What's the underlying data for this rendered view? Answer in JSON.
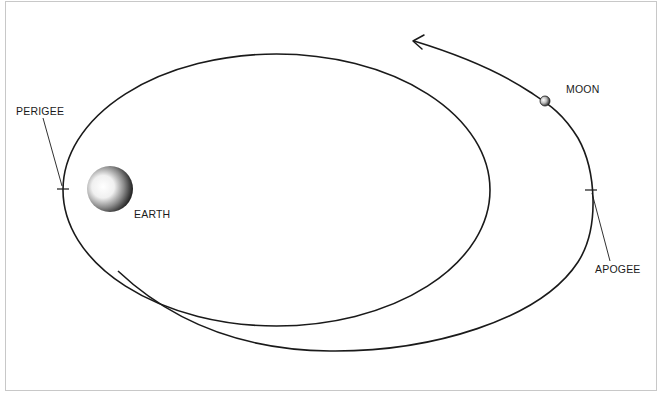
{
  "diagram": {
    "type": "orbit-diagram",
    "labels": {
      "perigee": "PERIGEE",
      "earth": "EARTH",
      "moon": "MOON",
      "apogee": "APOGEE"
    },
    "colors": {
      "line": "#1a1a1a",
      "frame_border": "#c8c8c8",
      "background": "#ffffff"
    },
    "elements": [
      {
        "name": "inner-orbit",
        "shape": "ellipse"
      },
      {
        "name": "outer-orbit-path",
        "shape": "spiral-arc",
        "arrow": "end"
      },
      {
        "name": "earth",
        "shape": "shaded-sphere"
      },
      {
        "name": "moon",
        "shape": "small-sphere"
      },
      {
        "name": "perigee-marker",
        "shape": "tick-with-leader"
      },
      {
        "name": "apogee-marker",
        "shape": "tick-with-leader"
      }
    ]
  }
}
